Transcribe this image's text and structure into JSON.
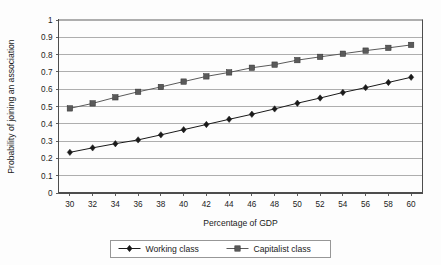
{
  "chart_data": {
    "type": "line",
    "title": "",
    "xlabel": "Percentage of GDP",
    "ylabel": "Probability of joining an association",
    "x": [
      30,
      32,
      34,
      36,
      38,
      40,
      42,
      44,
      46,
      48,
      50,
      52,
      54,
      56,
      58,
      60
    ],
    "xlim": [
      29,
      61
    ],
    "ylim": [
      0,
      1
    ],
    "xticks": [
      "30",
      "32",
      "34",
      "36",
      "38",
      "40",
      "42",
      "44",
      "46",
      "48",
      "50",
      "52",
      "54",
      "56",
      "58",
      "60"
    ],
    "yticks": [
      "0",
      "0.1",
      "0.2",
      "0.3",
      "0.4",
      "0.5",
      "0.6",
      "0.7",
      "0.8",
      "0.9",
      "1"
    ],
    "grid": "horizontal",
    "legend_position": "bottom",
    "series": [
      {
        "name": "Working class",
        "marker": "diamond",
        "color": "#1a1a1a",
        "values": [
          0.235,
          0.261,
          0.285,
          0.307,
          0.336,
          0.366,
          0.396,
          0.426,
          0.455,
          0.486,
          0.519,
          0.549,
          0.581,
          0.609,
          0.639,
          0.669
        ]
      },
      {
        "name": "Capitalist class",
        "marker": "square",
        "color": "#5a5a5a",
        "values": [
          0.489,
          0.518,
          0.553,
          0.585,
          0.613,
          0.644,
          0.674,
          0.697,
          0.724,
          0.742,
          0.768,
          0.787,
          0.805,
          0.823,
          0.839,
          0.856
        ]
      }
    ]
  },
  "colors": {
    "working_class": "#1a1a1a",
    "capitalist_class": "#5a5a5a",
    "gridline": "#9a9a9a",
    "axis": "#4d4d4d",
    "legend_border": "#8c8c8c",
    "background": "#fdfdfd"
  },
  "legend": {
    "items": [
      {
        "label": "Working class"
      },
      {
        "label": "Capitalist class"
      }
    ]
  },
  "axes": {
    "x_title": "Percentage of GDP",
    "y_title": "Probability of joining an association"
  }
}
